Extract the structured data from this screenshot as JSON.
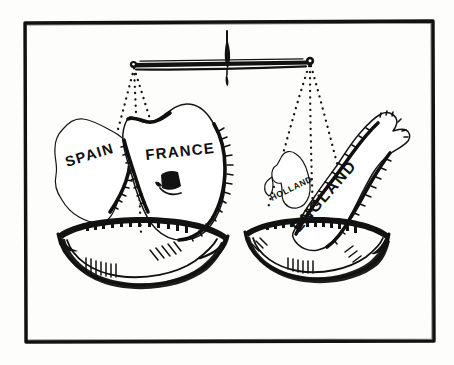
{
  "illustration": {
    "title": "Balance of Power",
    "medium": "pen-and-ink line drawing",
    "frame": {
      "present": true,
      "shape": "rectangle",
      "color": "#111111"
    },
    "background_color": "#fdfdfb",
    "ink_color": "#121212"
  },
  "scale": {
    "name": "balance-scale",
    "state": "level",
    "beam": {
      "orientation": "horizontal",
      "left_end_label": "",
      "right_end_label": ""
    },
    "pointer": {
      "name": "needle",
      "direction": "vertical"
    }
  },
  "pans": [
    {
      "side": "left",
      "name": "left-pan",
      "contents": [
        "SPAIN",
        "FRANCE"
      ]
    },
    {
      "side": "right",
      "name": "right-pan",
      "contents": [
        "HOLLAND",
        "ENGLAND"
      ]
    }
  ],
  "labels": {
    "spain": "SPAIN",
    "france": "FRANCE",
    "holland": "HOLLAND",
    "england": "ENGLAND"
  },
  "country_labels": [
    {
      "id": "spain",
      "text": "SPAIN",
      "pan": "left"
    },
    {
      "id": "france",
      "text": "FRANCE",
      "pan": "left"
    },
    {
      "id": "holland",
      "text": "HOLLAND",
      "pan": "right"
    },
    {
      "id": "england",
      "text": "ENGLAND",
      "pan": "right"
    }
  ]
}
